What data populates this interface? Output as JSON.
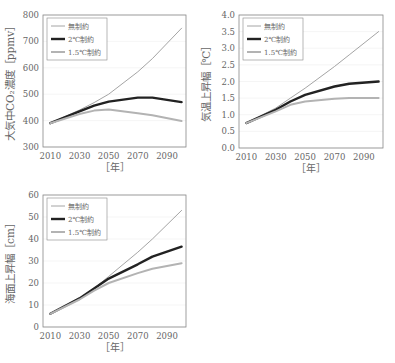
{
  "colors": {
    "none": "#9a9a9a",
    "two": "#222222",
    "onefive": "#b3b3b3",
    "axis": "#888888",
    "grid": "#eeeeee"
  },
  "legend": [
    "無制約",
    "2℃制約",
    "1.5℃制約"
  ],
  "chart_data": [
    {
      "type": "line",
      "title": "",
      "xlabel": "［年］",
      "ylabel": "大気中CO₂濃度［ppmv］",
      "x": [
        2010,
        2030,
        2040,
        2050,
        2070,
        2080,
        2100
      ],
      "xticks": [
        2010,
        2030,
        2050,
        2070,
        2090
      ],
      "yticks": [
        300,
        400,
        500,
        600,
        700,
        800
      ],
      "ylim": [
        300,
        800
      ],
      "xlim": [
        2000,
        2105
      ],
      "legend_position": "upper left",
      "series": [
        {
          "name": "無制約",
          "values": [
            390,
            440,
            468,
            500,
            585,
            635,
            750
          ]
        },
        {
          "name": "2℃制約",
          "values": [
            390,
            435,
            457,
            472,
            487,
            487,
            470
          ]
        },
        {
          "name": "1.5℃制約",
          "values": [
            390,
            425,
            438,
            442,
            428,
            420,
            398
          ]
        }
      ]
    },
    {
      "type": "line",
      "title": "",
      "xlabel": "［年］",
      "ylabel": "気温上昇幅［℃］",
      "x": [
        2010,
        2030,
        2040,
        2050,
        2070,
        2080,
        2100
      ],
      "xticks": [
        2010,
        2030,
        2050,
        2070,
        2090
      ],
      "yticks": [
        0.0,
        0.5,
        1.0,
        1.5,
        2.0,
        2.5,
        3.0,
        3.5,
        4.0
      ],
      "ylim": [
        0.0,
        4.0
      ],
      "xlim": [
        2000,
        2105
      ],
      "legend_position": "upper left",
      "series": [
        {
          "name": "無制約",
          "values": [
            0.75,
            1.2,
            1.5,
            1.8,
            2.45,
            2.8,
            3.5
          ]
        },
        {
          "name": "2℃制約",
          "values": [
            0.75,
            1.15,
            1.4,
            1.6,
            1.85,
            1.93,
            2.0
          ]
        },
        {
          "name": "1.5℃制約",
          "values": [
            0.75,
            1.1,
            1.3,
            1.4,
            1.48,
            1.5,
            1.5
          ]
        }
      ]
    },
    {
      "type": "line",
      "title": "",
      "xlabel": "［年］",
      "ylabel": "海面上昇幅［cm］",
      "x": [
        2010,
        2030,
        2040,
        2050,
        2070,
        2080,
        2100
      ],
      "xticks": [
        2010,
        2030,
        2050,
        2070,
        2090
      ],
      "yticks": [
        0,
        10,
        20,
        30,
        40,
        50,
        60
      ],
      "ylim": [
        0,
        60
      ],
      "xlim": [
        2000,
        2105
      ],
      "legend_position": "upper left",
      "series": [
        {
          "name": "無制約",
          "values": [
            6,
            13,
            17.5,
            23,
            34,
            40,
            53
          ]
        },
        {
          "name": "2℃制約",
          "values": [
            6,
            13,
            17.5,
            22,
            28.5,
            32,
            36.5
          ]
        },
        {
          "name": "1.5℃制約",
          "values": [
            6,
            12.5,
            16.5,
            20,
            24.5,
            26.5,
            29
          ]
        }
      ]
    }
  ]
}
